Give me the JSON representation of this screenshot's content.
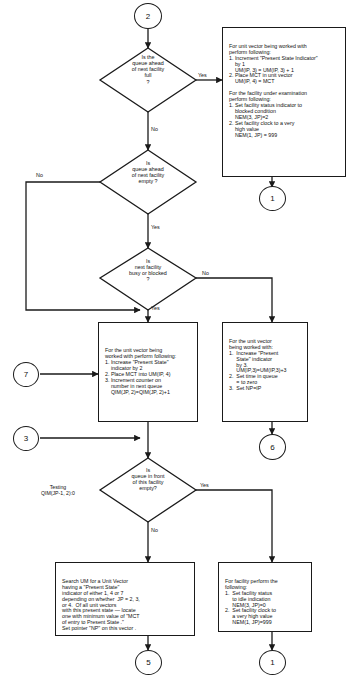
{
  "diagram": {
    "stroke_color": "#1a1a1a",
    "text_color": "#111111",
    "background": "#ffffff"
  },
  "connectors": [
    {
      "id": "conn-2-top",
      "label": "2"
    },
    {
      "id": "conn-1-right-top",
      "label": "1"
    },
    {
      "id": "conn-7-left",
      "label": "7"
    },
    {
      "id": "conn-3-left",
      "label": "3"
    },
    {
      "id": "conn-6-right",
      "label": "6"
    },
    {
      "id": "conn-5-bottom",
      "label": "5"
    },
    {
      "id": "conn-1-bottom",
      "label": "1"
    }
  ],
  "decisions": [
    {
      "id": "decision-queue-full",
      "text": "Is the\nqueue ahead\nof next facility\nfull\n?",
      "yes_label": "Yes",
      "no_label": "No"
    },
    {
      "id": "decision-queue-empty",
      "text": "Is\nqueue ahead\nof next facility\nempty ?",
      "yes_label": "Yes",
      "no_label": "No"
    },
    {
      "id": "decision-facility-busy",
      "text": "Is\nnext facility\nbusy or blocked\n?",
      "yes_label": "Yes",
      "no_label": "No"
    },
    {
      "id": "decision-queue-front-empty",
      "text": "Is\nqueue in front\nof this facility\nempty?",
      "yes_label": "Yes",
      "no_label": "No",
      "side_note": "Testing\nQIM(JP-1, 2):0"
    }
  ],
  "processes": [
    {
      "id": "process-blocked",
      "text": "For unit vector being worked with\nperform following:\n1. Increment \"Present State Indicator\"\n    by 1\n    UM(IP, 3) = UM(IP, 3) + 1\n2. Place MCT in unit vector\n    UM(IP, 4) = MCT\n\nFor the facility under examination\nperform following:\n1. Set facility status indicator to\n    blocked condition\n    NEM(3, JP)=2\n2. Set facility clock to a very\n    high value\n    NEM(1, JP) = 999"
    },
    {
      "id": "process-enqueue",
      "text": "For the unit vector being\nworked with perform following:\n1. Increase \"Present State\"\n    indicator by 2\n2. Place MCT into UM(IP, 4)\n3. Increment counter on\n    number in next queue\n    QIM(JP, 2)=QIM(JP, 2)+1"
    },
    {
      "id": "process-start-service",
      "text": "For the unit vector\nbeing worked with:\n1.  Increase \"Present\n     State\" indicator\n     by 3.\n     UM(IP,3)=UM(IP,3)+3\n2.  Set time in queue\n     = to zero\n3.  Set NP=IP"
    },
    {
      "id": "process-search-um",
      "text": "Search UM for a Unit Vector\nhaving a \"Present State\"\nindicator of either 1, 4 or 7\ndepending on whether  JP = 2, 3,\nor 4.  Of all unit vectors\nwith this present state — locate\none with minimum value of \"MCT\nof entry to Present State .\"\nSet pointer \"NP\" on this vector ."
    },
    {
      "id": "process-facility-idle",
      "text": "For facility perform the\nfollowing:\n1.  Set facility status\n     to idle indication\n     NEM(3, JP)=0\n2.  Set facility clock to\n     a very high value\n     NEM(1, JP)=999"
    }
  ]
}
